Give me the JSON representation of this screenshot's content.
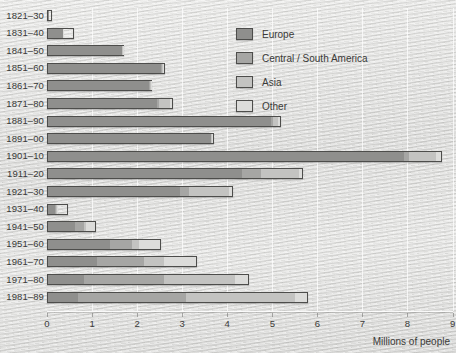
{
  "chart_data": {
    "type": "bar",
    "orientation": "horizontal",
    "stacked": true,
    "title": "",
    "xlabel": "Millions of people",
    "ylabel": "",
    "xlim": [
      0,
      9
    ],
    "xticks": [
      0,
      1,
      2,
      3,
      4,
      5,
      6,
      7,
      8,
      9
    ],
    "xticklabels": [
      "0",
      "1",
      "2",
      "3",
      "4",
      "5",
      "6",
      "7",
      "8",
      "9"
    ],
    "grid": true,
    "legend_position": "upper right",
    "categories": [
      "1821–30",
      "1831–40",
      "1841–50",
      "1851–60",
      "1861–70",
      "1871–80",
      "1881–90",
      "1891–00",
      "1901–10",
      "1911–20",
      "1921–30",
      "1931–40",
      "1941–50",
      "1951–60",
      "1961–70",
      "1971–80",
      "1981–89"
    ],
    "series": [
      {
        "name": "Europe",
        "color": "#8f8f8d",
        "values": [
          0.1,
          0.58,
          1.68,
          2.56,
          2.28,
          2.45,
          5.0,
          3.65,
          7.95,
          4.35,
          2.97,
          0.35,
          0.62,
          1.4,
          1.1,
          0.8,
          0.68
        ]
      },
      {
        "name": "Central / South America",
        "color": "#a6a6a4",
        "values": [
          0.0,
          0.01,
          0.01,
          0.02,
          0.02,
          0.05,
          0.03,
          0.02,
          0.1,
          0.42,
          0.2,
          0.05,
          0.22,
          0.5,
          1.05,
          1.8,
          2.4
        ]
      },
      {
        "name": "Asia",
        "color": "#c3c3c1",
        "values": [
          0.0,
          0.01,
          0.01,
          0.02,
          0.02,
          0.25,
          0.12,
          0.01,
          0.6,
          0.85,
          0.9,
          0.05,
          0.04,
          0.15,
          0.45,
          1.6,
          2.45
        ]
      },
      {
        "name": "Other",
        "color": "#dcdcda",
        "values": [
          0.01,
          0.01,
          0.01,
          0.02,
          0.01,
          0.05,
          0.04,
          0.02,
          0.12,
          0.06,
          0.06,
          0.02,
          0.21,
          0.48,
          0.73,
          0.28,
          0.27
        ]
      }
    ],
    "totals": [
      0.11,
      0.61,
      1.71,
      2.62,
      2.33,
      2.8,
      5.19,
      3.7,
      8.77,
      5.68,
      4.13,
      0.47,
      1.09,
      2.53,
      3.33,
      4.48,
      5.8
    ]
  },
  "legend": {
    "items": [
      {
        "label": "Europe",
        "key": "europe"
      },
      {
        "label": "Central / South America",
        "key": "csa"
      },
      {
        "label": "Asia",
        "key": "asia"
      },
      {
        "label": "Other",
        "key": "other"
      }
    ]
  },
  "axis": {
    "x_title": "Millions of people"
  }
}
